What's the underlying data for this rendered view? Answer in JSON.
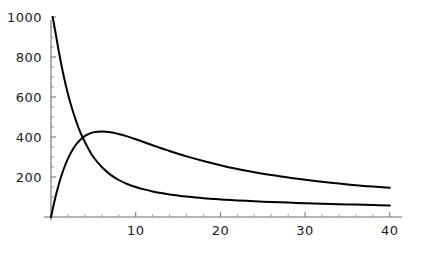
{
  "chart_data": {
    "type": "line",
    "title": "",
    "subtitle": "",
    "xlabel": "",
    "ylabel": "",
    "xlim": [
      0,
      41
    ],
    "ylim": [
      0,
      1050
    ],
    "grid": false,
    "legend": null,
    "background": "#ffffff",
    "axis_color": "#6e6e6e",
    "curve_color": "#000000",
    "x_ticks": [
      {
        "value": 10,
        "label": "10"
      },
      {
        "value": 20,
        "label": "20"
      },
      {
        "value": 30,
        "label": "30"
      },
      {
        "value": 40,
        "label": "40"
      }
    ],
    "x_minor_ticks": [
      2,
      4,
      6,
      8,
      12,
      14,
      16,
      18,
      22,
      24,
      26,
      28,
      32,
      34,
      36,
      38
    ],
    "y_ticks": [
      {
        "value": 200,
        "label": "200"
      },
      {
        "value": 400,
        "label": "400"
      },
      {
        "value": 600,
        "label": "600"
      },
      {
        "value": 800,
        "label": "800"
      },
      {
        "value": 1000,
        "label": "1000"
      }
    ],
    "y_minor_ticks": [
      50,
      100,
      150,
      250,
      300,
      350,
      450,
      500,
      550,
      650,
      700,
      750,
      850,
      900,
      950
    ],
    "series": [
      {
        "name": "decaying-curve",
        "x": [
          0.2,
          0.5,
          1,
          1.5,
          2,
          2.5,
          3,
          3.5,
          4,
          4.5,
          5,
          6,
          7,
          8,
          9,
          10,
          11,
          12,
          13,
          14,
          15,
          16,
          18,
          20,
          22,
          24,
          26,
          28,
          30,
          32,
          34,
          36,
          38,
          40
        ],
        "y": [
          1000,
          930,
          810,
          705,
          615,
          540,
          475,
          420,
          375,
          335,
          300,
          250,
          212,
          185,
          165,
          150,
          138,
          128,
          120,
          113,
          107,
          102,
          94,
          88,
          83,
          79,
          75,
          72,
          69,
          66,
          64,
          62,
          60,
          58
        ]
      },
      {
        "name": "rising-peaking-curve",
        "x": [
          0,
          0.5,
          1,
          1.5,
          2,
          2.5,
          3,
          3.5,
          4,
          4.5,
          5,
          5.5,
          6,
          6.5,
          7,
          7.5,
          8,
          9,
          10,
          11,
          12,
          13,
          14,
          15,
          16,
          18,
          20,
          22,
          24,
          26,
          28,
          30,
          32,
          34,
          36,
          38,
          40
        ],
        "y": [
          0,
          95,
          175,
          240,
          292,
          333,
          365,
          388,
          405,
          416,
          423,
          426,
          427,
          426,
          424,
          420,
          415,
          403,
          389,
          374,
          359,
          344,
          330,
          316,
          303,
          280,
          259,
          240,
          224,
          210,
          197,
          186,
          176,
          167,
          159,
          152,
          146
        ]
      }
    ]
  },
  "geometry": {
    "origin_px": {
      "x": 51,
      "y": 217
    },
    "x_scale_px_per_unit": 8.47,
    "y_scale_px_per_unit": 0.2,
    "axis_x_end_px": 402,
    "axis_y_top_px": 20,
    "major_tick_len": 5,
    "minor_tick_len": 3
  }
}
